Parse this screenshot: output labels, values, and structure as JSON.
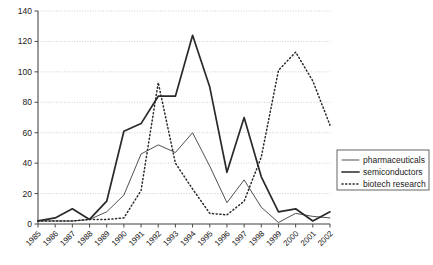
{
  "chart_data": {
    "type": "line",
    "title": "",
    "xlabel": "",
    "ylabel": "",
    "ylim": [
      0,
      140
    ],
    "ytick_step": 20,
    "yticks": [
      0,
      20,
      40,
      60,
      80,
      100,
      120,
      140
    ],
    "grid": true,
    "grid_style": "dotted-horizontal",
    "legend_position": "right-middle",
    "categories": [
      "1985",
      "1986",
      "1987",
      "1988",
      "1989",
      "1990",
      "1991",
      "1992",
      "1993",
      "1994",
      "1995",
      "1996",
      "1997",
      "1998",
      "1999",
      "2000",
      "2001",
      "2002"
    ],
    "series": [
      {
        "name": "pharmaceuticals",
        "style": "solid-thin",
        "color": "#3c3c3c",
        "values": [
          2,
          2,
          2,
          3,
          8,
          19,
          46,
          52,
          47,
          60,
          38,
          14,
          29,
          11,
          1,
          7,
          5,
          4
        ]
      },
      {
        "name": "semiconductors",
        "style": "solid-thick",
        "color": "#2a2a2a",
        "values": [
          2,
          4,
          10,
          3,
          15,
          61,
          66,
          84,
          84,
          124,
          90,
          34,
          70,
          31,
          8,
          10,
          2,
          8
        ]
      },
      {
        "name": "biotech research",
        "style": "dotted",
        "color": "#2a2a2a",
        "values": [
          2,
          2,
          2,
          3,
          3,
          4,
          22,
          93,
          40,
          23,
          7,
          6,
          15,
          44,
          101,
          113,
          94,
          65
        ]
      }
    ]
  },
  "axis": {
    "ytick_labels": [
      "0",
      "20",
      "40",
      "60",
      "80",
      "100",
      "120",
      "140"
    ],
    "xtick_labels": [
      "1985",
      "1986",
      "1987",
      "1988",
      "1989",
      "1990",
      "1991",
      "1992",
      "1993",
      "1994",
      "1995",
      "1996",
      "1997",
      "1998",
      "1999",
      "2000",
      "2001",
      "2002"
    ]
  },
  "legend": {
    "entries": [
      {
        "label": "pharmaceuticals",
        "marker": "line-thin-solid"
      },
      {
        "label": "semiconductors",
        "marker": "line-thick-solid"
      },
      {
        "label": "biotech research",
        "marker": "line-dotted"
      }
    ]
  }
}
